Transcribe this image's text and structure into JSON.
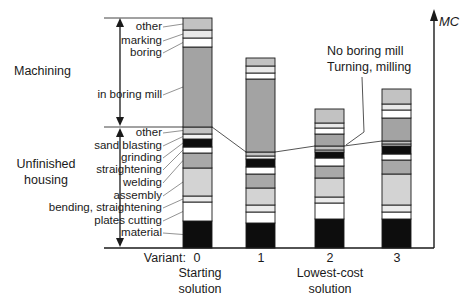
{
  "figure": {
    "axis": {
      "mc_label": "MC",
      "variant_label": "Variant:",
      "ticks": [
        "0",
        "1",
        "2",
        "3"
      ]
    },
    "groups": {
      "machining": {
        "label": "Machining"
      },
      "unfinished": {
        "label_line1": "Unfinished",
        "label_line2": "housing"
      }
    },
    "segment_labels": {
      "machining": [
        "other",
        "marking",
        "boring",
        "in boring mill"
      ],
      "unfinished": [
        "other",
        "sand blasting",
        "grinding",
        "straightening",
        "welding",
        "assembly",
        "bending, straightening",
        "plates cutting",
        "material"
      ]
    },
    "annotation": {
      "line1": "No boring mill",
      "line2": "Turning, milling"
    },
    "sublabels": {
      "variant0": {
        "line1": "Starting",
        "line2": "solution"
      },
      "variant2": {
        "line1": "Lowest-cost",
        "line2": "solution"
      }
    }
  },
  "chart_data": {
    "type": "bar",
    "stacked": true,
    "title": "",
    "xlabel": "Variant:",
    "ylabel": "MC",
    "x_categories": [
      "0",
      "1",
      "2",
      "3"
    ],
    "category_notes": [
      "Starting solution",
      "",
      "Lowest-cost solution",
      ""
    ],
    "value_scale": "estimated relative units (axis unlabeled)",
    "annotation": "No boring mill / Turning, milling (points to variants 2-3 machining block)",
    "series": [
      {
        "name": "material",
        "group": "unfinished housing",
        "color": "#0d0d0d",
        "values": [
          27,
          25,
          29,
          29
        ]
      },
      {
        "name": "plates cutting",
        "group": "unfinished housing",
        "color": "#ffffff",
        "values": [
          19,
          11,
          16,
          7
        ]
      },
      {
        "name": "bending, straightening",
        "group": "unfinished housing",
        "color": "#ebebeb",
        "values": [
          6,
          7,
          6,
          7
        ]
      },
      {
        "name": "assembly",
        "group": "unfinished housing",
        "color": "#d3d3d3",
        "values": [
          28,
          17,
          19,
          31
        ]
      },
      {
        "name": "welding",
        "group": "unfinished housing",
        "color": "#a8a8a8",
        "values": [
          15,
          14,
          12,
          14
        ]
      },
      {
        "name": "straightening",
        "group": "unfinished housing",
        "color": "#ffffff",
        "values": [
          6,
          7,
          8,
          6
        ]
      },
      {
        "name": "grinding",
        "group": "unfinished housing",
        "color": "#0d0d0d",
        "values": [
          8,
          8,
          6,
          8
        ]
      },
      {
        "name": "sand blasting",
        "group": "unfinished housing",
        "color": "#f3f3f3",
        "values": [
          5,
          3,
          2,
          2
        ]
      },
      {
        "name": "other (unfinished)",
        "group": "unfinished housing",
        "color": "#c2c2c2",
        "values": [
          7,
          4,
          4,
          3
        ]
      },
      {
        "name": "in boring mill / turning, milling",
        "group": "machining",
        "color": "#a3a3a3",
        "values": [
          80,
          73,
          12,
          23
        ]
      },
      {
        "name": "boring",
        "group": "machining",
        "color": "#ffffff",
        "values": [
          9,
          6,
          6,
          8
        ]
      },
      {
        "name": "marking",
        "group": "machining",
        "color": "#e9e9e9",
        "values": [
          8,
          7,
          5,
          6
        ]
      },
      {
        "name": "other (machining)",
        "group": "machining",
        "color": "#c2c2c2",
        "values": [
          12,
          8,
          14,
          15
        ]
      }
    ]
  }
}
